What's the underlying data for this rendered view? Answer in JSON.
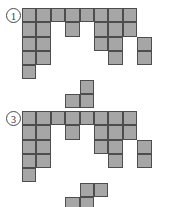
{
  "page": {
    "background": "#ffffff",
    "cell_fill": "#a6a6a6",
    "cell_stroke": "#4d4d4d",
    "cell_size": 14.4
  },
  "figures": [
    {
      "id": "figure-1",
      "label": "①",
      "label_text": "1",
      "origin": {
        "x": 22,
        "y": 8
      },
      "grid_cols": 9,
      "grid_rows": 7,
      "cells": [
        [
          0,
          0
        ],
        [
          1,
          0
        ],
        [
          2,
          0
        ],
        [
          3,
          0
        ],
        [
          4,
          0
        ],
        [
          5,
          0
        ],
        [
          6,
          0
        ],
        [
          7,
          0
        ],
        [
          0,
          1
        ],
        [
          1,
          1
        ],
        [
          3,
          1
        ],
        [
          5,
          1
        ],
        [
          6,
          1
        ],
        [
          7,
          1
        ],
        [
          0,
          2
        ],
        [
          1,
          2
        ],
        [
          5,
          2
        ],
        [
          6,
          2
        ],
        [
          8,
          2
        ],
        [
          0,
          3
        ],
        [
          1,
          3
        ],
        [
          6,
          3
        ],
        [
          8,
          3
        ],
        [
          0,
          4
        ],
        [
          4,
          5
        ],
        [
          3,
          6
        ],
        [
          4,
          6
        ]
      ]
    },
    {
      "id": "figure-3",
      "label": "③",
      "label_text": "3",
      "origin": {
        "x": 22,
        "y": 8
      },
      "grid_cols": 9,
      "grid_rows": 7,
      "cells": [
        [
          0,
          0
        ],
        [
          1,
          0
        ],
        [
          2,
          0
        ],
        [
          3,
          0
        ],
        [
          4,
          0
        ],
        [
          5,
          0
        ],
        [
          6,
          0
        ],
        [
          7,
          0
        ],
        [
          0,
          1
        ],
        [
          1,
          1
        ],
        [
          3,
          1
        ],
        [
          5,
          1
        ],
        [
          6,
          1
        ],
        [
          7,
          1
        ],
        [
          0,
          2
        ],
        [
          1,
          2
        ],
        [
          5,
          2
        ],
        [
          6,
          2
        ],
        [
          8,
          2
        ],
        [
          0,
          3
        ],
        [
          1,
          3
        ],
        [
          6,
          3
        ],
        [
          8,
          3
        ],
        [
          0,
          4
        ],
        [
          4,
          5
        ],
        [
          5,
          5
        ],
        [
          3,
          6
        ],
        [
          4,
          6
        ]
      ]
    }
  ]
}
